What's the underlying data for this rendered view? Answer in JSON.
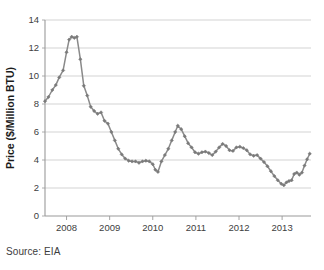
{
  "source_note": "Source: EIA",
  "chart_data": {
    "type": "line",
    "title": "",
    "subtitle": "",
    "xlabel": "",
    "ylabel": "Price ($/Million BTU)",
    "ylim": [
      0,
      14
    ],
    "xlim": [
      2007.5,
      2013.67
    ],
    "y_ticks": [
      0,
      2,
      4,
      6,
      8,
      10,
      12,
      14
    ],
    "y_tick_labels": [
      "0",
      "2",
      "4",
      "6",
      "8",
      "10",
      "12",
      "14"
    ],
    "x_ticks": [
      2008,
      2009,
      2010,
      2011,
      2012,
      2013
    ],
    "x_tick_labels": [
      "2008",
      "2009",
      "2010",
      "2011",
      "2012",
      "2013"
    ],
    "grid": "horizontal",
    "legend": null,
    "legend_position": "none",
    "line_color": "#8a8a8a",
    "marker": "diamond",
    "marker_color": "#7a7a7a",
    "axis_color": "#9a9a9a",
    "grid_color": "#c8c8c8",
    "series": [
      {
        "name": "Natural gas price",
        "x": [
          2007.5,
          2007.58,
          2007.67,
          2007.75,
          2007.83,
          2007.92,
          2008.0,
          2008.08,
          2008.17,
          2008.25,
          2008.33,
          2008.42,
          2008.5,
          2008.58,
          2008.67,
          2008.75,
          2008.83,
          2008.92,
          2009.0,
          2009.08,
          2009.17,
          2009.25,
          2009.33,
          2009.42,
          2009.5,
          2009.58,
          2009.67,
          2009.75,
          2009.83,
          2009.92,
          2010.0,
          2010.08,
          2010.17,
          2010.25,
          2010.33,
          2010.42,
          2010.5,
          2010.58,
          2010.67,
          2010.75,
          2010.83,
          2010.92,
          2011.0,
          2011.08,
          2011.17,
          2011.25,
          2011.33,
          2011.42,
          2011.5,
          2011.58,
          2011.67,
          2011.75,
          2011.83,
          2011.92,
          2012.0,
          2012.08,
          2012.17,
          2012.25,
          2012.33,
          2012.42,
          2012.5,
          2012.58,
          2012.67,
          2012.75,
          2012.83,
          2012.92,
          2013.0,
          2013.08,
          2013.17,
          2013.25,
          2013.33,
          2013.42,
          2013.5,
          2013.58,
          2013.67
        ],
        "values": [
          8.2,
          8.5,
          9.0,
          9.4,
          9.9,
          10.4,
          11.7,
          12.6,
          12.8,
          12.75,
          12.8,
          11.2,
          9.3,
          8.6,
          7.8,
          7.5,
          7.3,
          7.4,
          6.8,
          6.6,
          6.0,
          5.4,
          4.8,
          4.4,
          4.1,
          3.95,
          3.9,
          3.9,
          3.8,
          3.9,
          3.95,
          3.9,
          3.7,
          3.3,
          3.15,
          3.9,
          4.35,
          4.8,
          5.4,
          6.0,
          6.45,
          6.2,
          5.7,
          5.2,
          4.9,
          4.55,
          4.45,
          4.55,
          4.6,
          4.5,
          4.35,
          4.6,
          4.9,
          5.15,
          5.0,
          4.7,
          4.65,
          4.9,
          4.95,
          4.85,
          4.7,
          4.4,
          4.3,
          4.35,
          4.1,
          3.85,
          3.55,
          3.2,
          2.85,
          2.55,
          2.3,
          2.2,
          2.4,
          2.5,
          2.55
        ],
        "segments_note": "monthly spot price series",
        "annotations": []
      }
    ],
    "series_tail": {
      "name": "Natural gas price (continued)",
      "x": [
        2011.92,
        2012.0,
        2012.08,
        2012.17,
        2012.25,
        2012.33,
        2012.42,
        2012.5,
        2012.58,
        2012.67,
        2012.75,
        2012.83,
        2012.92,
        2013.0,
        2013.08,
        2013.17,
        2013.25,
        2013.33,
        2013.42,
        2013.5,
        2013.58,
        2013.67
      ],
      "values": [
        2.55,
        2.65,
        2.7,
        3.0,
        3.1,
        2.95,
        3.1,
        3.6,
        4.05,
        4.45,
        4.4,
        4.55,
        4.3,
        4.45,
        4.4,
        4.45,
        4.4,
        3.9,
        3.6,
        4.0,
        4.15,
        5.4
      ]
    },
    "points": [
      [
        2007.5,
        8.2
      ],
      [
        2007.58,
        8.5
      ],
      [
        2007.67,
        9.0
      ],
      [
        2007.75,
        9.35
      ],
      [
        2007.83,
        9.9
      ],
      [
        2007.92,
        10.4
      ],
      [
        2008.0,
        11.7
      ],
      [
        2008.06,
        12.6
      ],
      [
        2008.12,
        12.8
      ],
      [
        2008.18,
        12.72
      ],
      [
        2008.24,
        12.8
      ],
      [
        2008.32,
        11.2
      ],
      [
        2008.4,
        9.3
      ],
      [
        2008.48,
        8.6
      ],
      [
        2008.56,
        7.8
      ],
      [
        2008.64,
        7.5
      ],
      [
        2008.72,
        7.3
      ],
      [
        2008.8,
        7.4
      ],
      [
        2008.88,
        6.8
      ],
      [
        2008.96,
        6.6
      ],
      [
        2009.04,
        6.0
      ],
      [
        2009.12,
        5.4
      ],
      [
        2009.2,
        4.8
      ],
      [
        2009.28,
        4.4
      ],
      [
        2009.36,
        4.1
      ],
      [
        2009.44,
        3.95
      ],
      [
        2009.52,
        3.9
      ],
      [
        2009.6,
        3.9
      ],
      [
        2009.68,
        3.8
      ],
      [
        2009.76,
        3.9
      ],
      [
        2009.84,
        3.95
      ],
      [
        2009.92,
        3.9
      ],
      [
        2010.0,
        3.7
      ],
      [
        2010.06,
        3.3
      ],
      [
        2010.12,
        3.15
      ],
      [
        2010.2,
        3.9
      ],
      [
        2010.28,
        4.35
      ],
      [
        2010.36,
        4.8
      ],
      [
        2010.44,
        5.4
      ],
      [
        2010.52,
        6.0
      ],
      [
        2010.58,
        6.45
      ],
      [
        2010.66,
        6.2
      ],
      [
        2010.74,
        5.7
      ],
      [
        2010.82,
        5.2
      ],
      [
        2010.9,
        4.9
      ],
      [
        2010.98,
        4.55
      ],
      [
        2011.06,
        4.45
      ],
      [
        2011.14,
        4.55
      ],
      [
        2011.22,
        4.6
      ],
      [
        2011.3,
        4.5
      ],
      [
        2011.38,
        4.35
      ],
      [
        2011.46,
        4.6
      ],
      [
        2011.54,
        4.9
      ],
      [
        2011.62,
        5.15
      ],
      [
        2011.7,
        5.0
      ],
      [
        2011.78,
        4.7
      ],
      [
        2011.86,
        4.65
      ],
      [
        2011.94,
        4.9
      ],
      [
        2012.02,
        4.95
      ],
      [
        2012.1,
        4.85
      ],
      [
        2012.18,
        4.7
      ],
      [
        2012.26,
        4.4
      ],
      [
        2012.34,
        4.3
      ],
      [
        2012.42,
        4.35
      ],
      [
        2012.5,
        4.1
      ],
      [
        2012.58,
        3.85
      ],
      [
        2012.66,
        3.55
      ],
      [
        2012.74,
        3.2
      ],
      [
        2012.82,
        2.85
      ],
      [
        2012.9,
        2.55
      ],
      [
        2012.98,
        2.3
      ],
      [
        2013.04,
        2.2
      ],
      [
        2013.1,
        2.4
      ],
      [
        2013.16,
        2.5
      ],
      [
        2013.22,
        2.55
      ],
      [
        2013.28,
        3.0
      ],
      [
        2013.34,
        3.1
      ],
      [
        2013.4,
        2.95
      ],
      [
        2013.46,
        3.1
      ],
      [
        2013.52,
        3.6
      ],
      [
        2013.58,
        4.05
      ],
      [
        2013.64,
        4.45
      ]
    ],
    "data_monthly": {
      "start": "2007-07",
      "end": "2013-09",
      "frequency": "monthly",
      "values": [
        8.2,
        8.5,
        9.0,
        9.35,
        9.9,
        10.4,
        11.7,
        12.6,
        12.8,
        12.72,
        12.8,
        11.2,
        9.3,
        8.6,
        7.8,
        7.5,
        7.3,
        7.4,
        6.8,
        6.6,
        6.0,
        5.4,
        4.8,
        4.4,
        4.1,
        3.95,
        3.9,
        3.9,
        3.8,
        3.9,
        3.95,
        3.9,
        3.7,
        3.3,
        3.15,
        3.9,
        4.35,
        4.8,
        5.4,
        6.0,
        6.45,
        6.2,
        5.7,
        5.2,
        4.9,
        4.55,
        4.45,
        4.55,
        4.6,
        4.5,
        4.35,
        4.6,
        4.9,
        5.15,
        5.0,
        4.7,
        4.65,
        4.9,
        4.95,
        4.85,
        4.7,
        4.4,
        4.3,
        4.35,
        4.1,
        3.85,
        3.55,
        3.2,
        2.85,
        2.55,
        2.3,
        2.2,
        2.4,
        2.5,
        2.55,
        3.0,
        3.1,
        2.95,
        3.1,
        3.6,
        4.05,
        4.45,
        4.4,
        4.55,
        4.3,
        4.45,
        4.4,
        4.45,
        4.4,
        3.9,
        3.6,
        4.0,
        4.15,
        5.4
      ]
    },
    "key_features": {
      "peak_value": 12.8,
      "peak_period": "mid-2008",
      "first_trough_value": 3.15,
      "first_trough_period": "late 2009",
      "secondary_peak_value": 6.45,
      "secondary_peak_period": "early 2010",
      "minimum_value": 2.2,
      "minimum_period": "early 2012",
      "final_value": 5.4,
      "start_value": 8.2
    }
  }
}
